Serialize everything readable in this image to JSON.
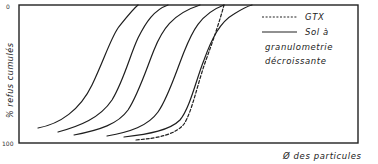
{
  "chart_data": {
    "type": "line",
    "title": "",
    "xlabel": "Ø des particules",
    "ylabel": "% refus cumulés",
    "y_ticks": [
      "0",
      "100"
    ],
    "y_direction": "0 at top, 100 at bottom",
    "grid": false,
    "legend_position": "top-right inside frame",
    "legend": [
      {
        "label": "GTX",
        "style": "dashed"
      },
      {
        "label": "Sol à granulometrie décroissante",
        "style": "solid"
      }
    ],
    "series": [
      {
        "name": "Sol à granulometrie décroissante 1",
        "style": "solid",
        "path": "M38,128 C60,124 80,110 92,85 C104,60 110,40 118,28 C126,18 132,10 138,5"
      },
      {
        "name": "Sol à granulometrie décroissante 2",
        "style": "solid",
        "path": "M58,132 C80,126 100,118 112,100 C124,80 130,55 138,38 C146,22 154,10 168,5"
      },
      {
        "name": "Sol à granulometrie décroissante 3",
        "style": "solid",
        "path": "M74,135 C100,130 118,124 128,110 C138,95 146,70 154,50 C162,30 172,14 200,5"
      },
      {
        "name": "Sol à granulometrie décroissante 4",
        "style": "solid",
        "path": "M107,136 C130,132 148,126 158,112 C168,98 176,72 184,52 C192,32 200,14 224,5"
      },
      {
        "name": "Sol à granulometrie décroissante 5",
        "style": "solid",
        "path": "M124,137 C150,134 170,130 180,120 C190,108 196,80 204,60 C212,38 220,22 234,14 C242,9 248,6 252,5"
      },
      {
        "name": "GTX",
        "style": "dashed",
        "path": "M136,140 C160,138 176,134 184,124 C192,112 198,82 206,60 C214,38 220,20 224,5"
      }
    ]
  },
  "labels": {
    "y_axis": "% refus cumulés",
    "x_axis": "Ø des particules",
    "y_top": "0",
    "y_bottom": "100",
    "legend_gtx": "GTX",
    "legend_sol_line1": "Sol à",
    "legend_sol_line2": "granulometrie",
    "legend_sol_line3": "décroissante"
  }
}
